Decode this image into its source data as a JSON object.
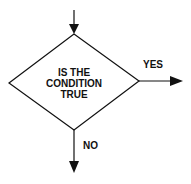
{
  "diagram": {
    "type": "flowchart-decision",
    "decision": {
      "lines": [
        "IS THE",
        "CONDITION",
        "TRUE"
      ]
    },
    "branches": {
      "yes_label": "YES",
      "no_label": "NO"
    },
    "colors": {
      "stroke": "#111111",
      "background": "#ffffff"
    }
  }
}
